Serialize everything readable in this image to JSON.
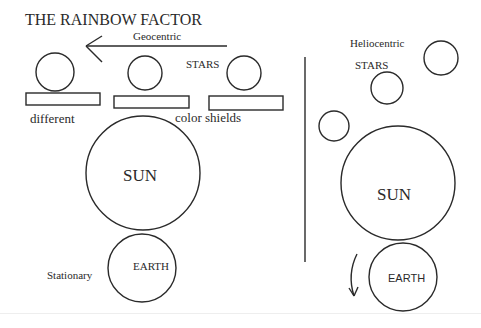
{
  "title": "THE RAINBOW FACTOR",
  "geocentric": {
    "label": "Geocentric",
    "stars_label": "STARS",
    "shields_label_left": "different",
    "shields_label_right": "color shields",
    "sun_label": "SUN",
    "earth_label": "EARTH",
    "earth_note": "Stationary",
    "arrow_direction": "left"
  },
  "heliocentric": {
    "label": "Heliocentric",
    "stars_label": "STARS",
    "sun_label": "SUN",
    "earth_label": "EARTH",
    "earth_motion_arrow": "curved-down"
  },
  "colors": {
    "ink": "#2a2a2a",
    "background": "#ffffff"
  }
}
